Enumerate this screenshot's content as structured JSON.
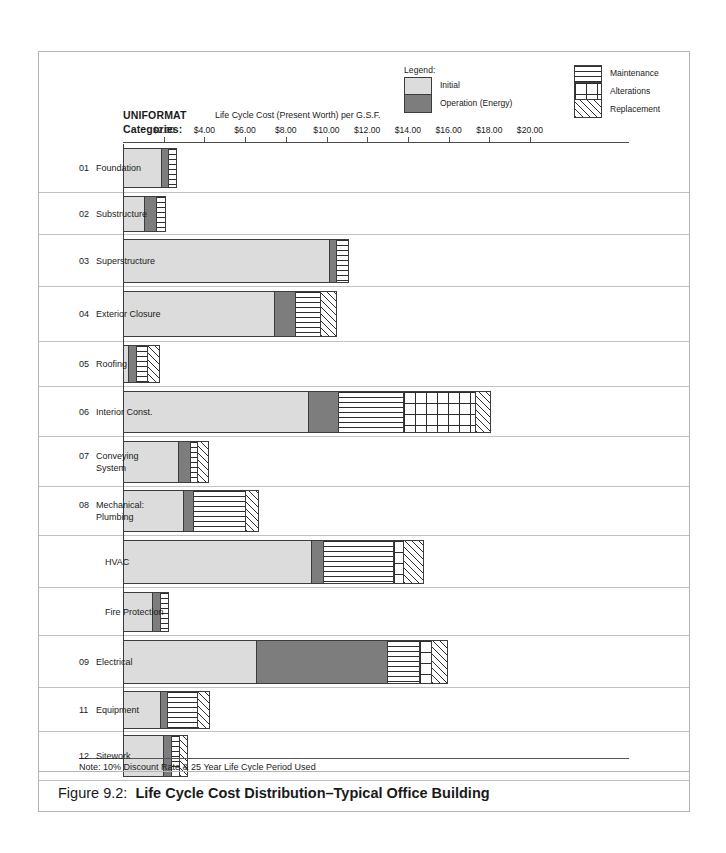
{
  "figure": {
    "caption_figure_number": "Figure 9.2:",
    "caption_title": "Life Cycle Cost Distribution–Typical Office Building",
    "note": "Note: 10% Discount Rate & 25 Year Life Cycle Period Used"
  },
  "headings": {
    "categories_heading_line1": "UNIFORMAT",
    "categories_heading_line2": "Categories:",
    "axis_title": "Life Cycle Cost (Present Worth) per G.S.F."
  },
  "legend": {
    "title": "Legend:",
    "items": [
      {
        "key": "initial",
        "label": "Initial"
      },
      {
        "key": "operation",
        "label": "Operation  (Energy)"
      },
      {
        "key": "maintenance",
        "label": "Maintenance"
      },
      {
        "key": "alterations",
        "label": "Alterations"
      },
      {
        "key": "replacement",
        "label": "Replacement"
      }
    ]
  },
  "colors": {
    "initial": "#dcdcdc",
    "operation": "#7d7d7d",
    "outline": "#3c3c3c",
    "gridline": "#c2c2c2",
    "axis": "#4a4a4a",
    "frame": "#b4b4b4"
  },
  "chart_data": {
    "type": "bar",
    "orientation": "horizontal",
    "stacked": true,
    "title": "Life Cycle Cost Distribution–Typical Office Building",
    "xlabel": "Life Cycle Cost (Present Worth) per G.S.F.",
    "ylabel": "UNIFORMAT Categories:",
    "xlim": [
      0,
      20.5
    ],
    "grid": false,
    "legend_position": "top-right",
    "tick_values": [
      2,
      4,
      6,
      8,
      10,
      12,
      14,
      16,
      18,
      20
    ],
    "tick_labels": [
      "$2.00",
      "$4.00",
      "$6.00",
      "$8.00",
      "$10.00",
      "$12.00",
      "$14.00",
      "$16.00",
      "$18.00",
      "$20.00"
    ],
    "categories": [
      "01  Foundation",
      "02  Substructure",
      "03  Superstructure",
      "04  Exterior Closure",
      "05  Roofing",
      "06  Interior Const.",
      "07  Conveying System",
      "08  Mechanical: Plumbing",
      "HVAC",
      "Fire Protection",
      "09  Electrical",
      "11  Equipment",
      "12  Sitework"
    ],
    "series": [
      {
        "name": "Initial",
        "values": [
          1.9,
          1.1,
          10.15,
          7.45,
          0.3,
          9.15,
          2.75,
          3.0,
          9.3,
          1.45,
          6.6,
          1.85,
          2.0
        ]
      },
      {
        "name": "Operation (Energy)",
        "values": [
          0.35,
          0.55,
          0.35,
          1.05,
          0.4,
          1.45,
          0.6,
          0.5,
          0.6,
          0.4,
          6.4,
          0.35,
          0.4
        ]
      },
      {
        "name": "Maintenance",
        "values": [
          0.4,
          0.45,
          0.6,
          1.25,
          0.55,
          3.2,
          0.35,
          2.55,
          3.4,
          0.4,
          1.6,
          1.5,
          0.4
        ]
      },
      {
        "name": "Alterations",
        "values": [
          0.0,
          0.0,
          0.0,
          0.0,
          0.0,
          3.55,
          0.0,
          0.0,
          0.5,
          0.0,
          0.6,
          0.0,
          0.0
        ]
      },
      {
        "name": "Replacement",
        "values": [
          0.0,
          0.0,
          0.0,
          0.75,
          0.55,
          0.75,
          0.55,
          0.65,
          1.0,
          0.0,
          0.75,
          0.6,
          0.4
        ]
      }
    ]
  },
  "rows": [
    {
      "id": "01",
      "name": "Foundation",
      "multiline": false
    },
    {
      "id": "02",
      "name": "Substructure",
      "multiline": false
    },
    {
      "id": "03",
      "name": "Superstructure",
      "multiline": false
    },
    {
      "id": "04",
      "name": "Exterior Closure",
      "multiline": false
    },
    {
      "id": "05",
      "name": "Roofing",
      "multiline": false
    },
    {
      "id": "06",
      "name": "Interior Const.",
      "multiline": false
    },
    {
      "id": "07",
      "name": "Conveying\nSystem",
      "multiline": true
    },
    {
      "id": "08",
      "name": "Mechanical:\nPlumbing",
      "multiline": true
    },
    {
      "id": "",
      "name": "HVAC",
      "multiline": false
    },
    {
      "id": "",
      "name": "Fire Protection",
      "multiline": false
    },
    {
      "id": "09",
      "name": "Electrical",
      "multiline": false
    },
    {
      "id": "11",
      "name": "Equipment",
      "multiline": false
    },
    {
      "id": "12",
      "name": "Sitework",
      "multiline": false
    }
  ]
}
